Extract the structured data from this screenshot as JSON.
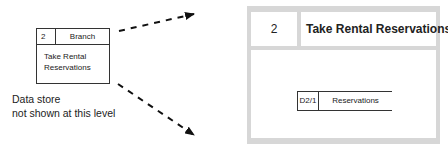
{
  "small_process": {
    "id": "2",
    "location": "Branch",
    "name_line1": "Take Rental",
    "name_line2": "Reservations"
  },
  "note": {
    "line1": "Data store",
    "line2": "not shown at this level"
  },
  "large_process": {
    "id": "2",
    "title": "Take Rental Reservations"
  },
  "data_store": {
    "id": "D2/1",
    "name": "Reservations"
  },
  "colors": {
    "frame": "#d7d7d7",
    "line": "#222222",
    "background": "#ffffff"
  },
  "arrows": [
    {
      "name": "expand-arrow-top",
      "style": "dashed",
      "from": "small-process",
      "to": "large-process-top"
    },
    {
      "name": "expand-arrow-bottom",
      "style": "dashed",
      "from": "small-process",
      "to": "large-process-bottom"
    }
  ]
}
